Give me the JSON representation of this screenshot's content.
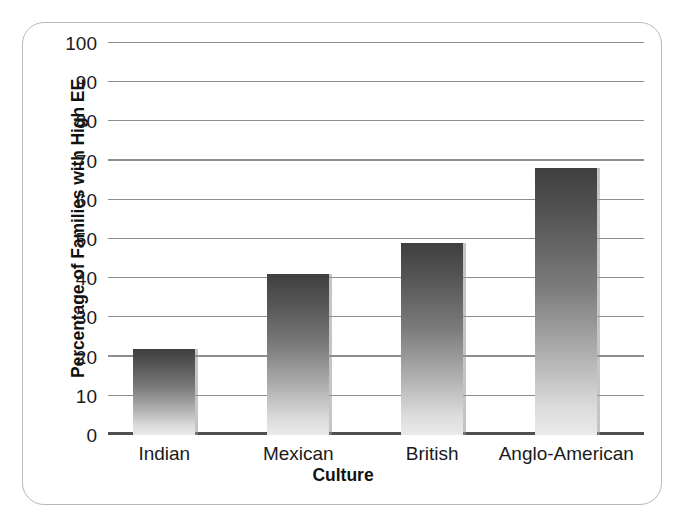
{
  "chart_data": {
    "type": "bar",
    "title": "",
    "xlabel": "Culture",
    "ylabel": "Percentage of Families with High EE",
    "categories": [
      "Indian",
      "Mexican",
      "British",
      "Anglo-American"
    ],
    "values": [
      22,
      41,
      49,
      68
    ],
    "ylim": [
      0,
      100
    ],
    "yticks": [
      0,
      10,
      20,
      30,
      40,
      50,
      60,
      70,
      80,
      90,
      100
    ],
    "ytick_labels": [
      "0",
      "10",
      "20",
      "30",
      "40",
      "50",
      "60",
      "70",
      "80",
      "90",
      "100"
    ],
    "grid": true,
    "legend": false,
    "legend_position": "none",
    "bar_gradient_top": "#3f3f3f",
    "bar_gradient_bottom": "#eaeaea",
    "gridline_color": "#8d8d8d",
    "axis_color": "#4f4f4f",
    "frame_color": "#b9b9b9",
    "background": "#ffffff"
  },
  "figure": {
    "caption_fragment": ""
  }
}
